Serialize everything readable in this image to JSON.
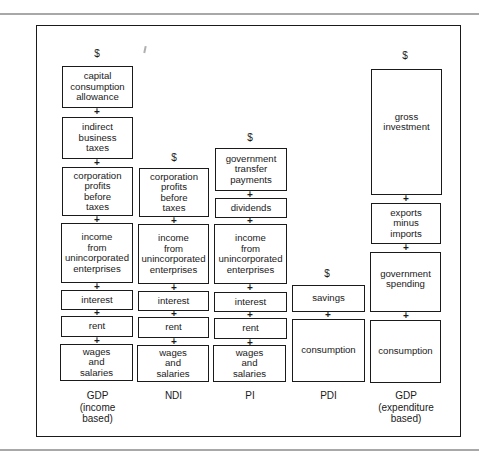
{
  "diagram": {
    "title": "",
    "currency_symbol": "$",
    "plus_symbol": "+",
    "columns": [
      {
        "id": "gdp-income",
        "label": "GDP\n(income\nbased)",
        "components_top_to_bottom": [
          "capital\nconsumption\nallowance",
          "indirect\nbusiness\ntaxes",
          "corporation\nprofits\nbefore\ntaxes",
          "income\nfrom\nunincorporated\nenterprises",
          "interest",
          "rent",
          "wages\nand\nsalaries"
        ]
      },
      {
        "id": "ndi",
        "label": "NDI",
        "components_top_to_bottom": [
          "corporation\nprofits\nbefore\ntaxes",
          "income\nfrom\nunincorporated\nenterprises",
          "interest",
          "rent",
          "wages\nand\nsalaries"
        ]
      },
      {
        "id": "pi",
        "label": "PI",
        "components_top_to_bottom": [
          "government\ntransfer\npayments",
          "dividends",
          "income\nfrom\nunincorporated\nenterprises",
          "interest",
          "rent",
          "wages\nand\nsalaries"
        ]
      },
      {
        "id": "pdi",
        "label": "PDI",
        "components_top_to_bottom": [
          "savings",
          "consumption"
        ]
      },
      {
        "id": "gdp-expenditure",
        "label": "GDP\n(expenditure\nbased)",
        "components_top_to_bottom": [
          "gross\ninvestment",
          "exports\nminus\nimports",
          "government\nspending",
          "consumption"
        ]
      }
    ]
  }
}
